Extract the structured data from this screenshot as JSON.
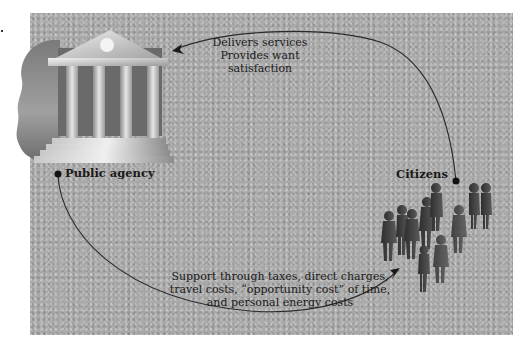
{
  "diagram": {
    "nodes": {
      "agency": {
        "label": "Public agency",
        "icon": "government-building-icon"
      },
      "citizens": {
        "label": "Citizens",
        "icon": "crowd-of-people-icon"
      }
    },
    "edges": {
      "to_citizens_from_agency": {
        "lines": [
          "Delivers services",
          "Provides want",
          "satisfaction"
        ]
      },
      "to_agency_from_citizens": {
        "lines": [
          "Support through taxes, direct charges,",
          "travel costs, “opportunity cost” of time,",
          "and personal energy costs"
        ]
      }
    },
    "colors": {
      "background_panel": "#a9a9a9",
      "line": "#2a2a2a",
      "text": "#1a1a1a",
      "figures": "#3c3c3c"
    }
  }
}
